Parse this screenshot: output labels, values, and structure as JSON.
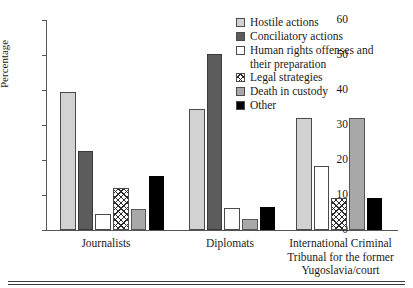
{
  "chart_data": {
    "type": "bar",
    "title": "",
    "xlabel": "",
    "ylabel": "Percentage",
    "ylim": [
      0,
      60
    ],
    "yticks": [
      0,
      10,
      20,
      30,
      40,
      50,
      60
    ],
    "grid": false,
    "legend_position": "top-right",
    "categories": [
      "Journalists",
      "Diplomats",
      "International Criminal Tribunal for the former Yugoslavia/court"
    ],
    "series": [
      {
        "name": "Hostile actions",
        "fill": "light-gray",
        "values": [
          39.3,
          34.5,
          32.0
        ]
      },
      {
        "name": "Conciliatory actions",
        "fill": "dark-gray",
        "values": [
          22.7,
          50.3,
          0
        ]
      },
      {
        "name": "Human rights offenses and their preparation",
        "fill": "white",
        "values": [
          4.7,
          6.2,
          18.4
        ]
      },
      {
        "name": "Legal strategies",
        "fill": "crosshatch",
        "values": [
          12.0,
          0,
          9.2
        ]
      },
      {
        "name": "Death in custody",
        "fill": "medium-gray",
        "values": [
          6.0,
          3.2,
          32.0
        ]
      },
      {
        "name": "Other",
        "fill": "black",
        "values": [
          15.3,
          6.5,
          9.2
        ]
      }
    ]
  },
  "axis": {
    "y_title": "Percentage",
    "tick_labels": [
      "60",
      "50",
      "40",
      "30",
      "20",
      "10",
      "0"
    ]
  },
  "legend": {
    "items": [
      {
        "label": "Hostile actions",
        "cont": ""
      },
      {
        "label": "Conciliatory actions",
        "cont": ""
      },
      {
        "label": "Human rights offenses and",
        "cont": "their preparation"
      },
      {
        "label": "Legal strategies",
        "cont": ""
      },
      {
        "label": "Death in custody",
        "cont": ""
      },
      {
        "label": "Other",
        "cont": ""
      }
    ]
  },
  "groups": [
    {
      "label_line1": "Journalists",
      "label_line2": "",
      "label_line3": ""
    },
    {
      "label_line1": "Diplomats",
      "label_line2": "",
      "label_line3": ""
    },
    {
      "label_line1": "International Criminal",
      "label_line2": "Tribunal for the former",
      "label_line3": "Yugoslavia/court"
    }
  ]
}
